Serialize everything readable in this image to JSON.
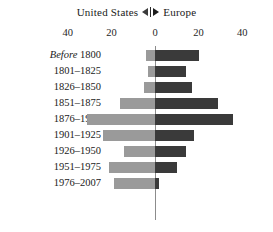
{
  "legend": {
    "left_label": "United States",
    "left_marker_icon": "triangle-left-icon",
    "divider_icon": "legend-divider-icon",
    "right_marker_icon": "triangle-right-icon",
    "right_label": "Europe"
  },
  "axis": {
    "tick_labels": [
      "40",
      "20",
      "0",
      "20",
      "40"
    ],
    "tick_values": [
      -40,
      -20,
      0,
      20,
      40
    ]
  },
  "colors": {
    "united_states_bar": "#9a9a9a",
    "europe_bar": "#3a3a3a",
    "zero_line": "#8c8c8c",
    "background": "#ffffff",
    "text": "#1a1a1a"
  },
  "chart_data": {
    "type": "bar",
    "title": "",
    "subtitle": "",
    "orientation": "horizontal-diverging",
    "xlabel": "",
    "ylabel": "",
    "xlim": [
      -40,
      40
    ],
    "grid": false,
    "legend_position": "top-center",
    "categories": [
      "Before 1800",
      "1801–1825",
      "1826–1850",
      "1851–1875",
      "1876–1900",
      "1901–1925",
      "1926–1950",
      "1951–1975",
      "1976–2007"
    ],
    "series": [
      {
        "name": "United States",
        "direction": "left",
        "color": "#9a9a9a",
        "values": [
          4,
          3,
          5,
          16,
          31,
          24,
          14,
          21,
          19
        ]
      },
      {
        "name": "Europe",
        "direction": "right",
        "color": "#3a3a3a",
        "values": [
          20,
          14,
          17,
          29,
          36,
          18,
          14,
          10,
          2
        ]
      }
    ]
  }
}
